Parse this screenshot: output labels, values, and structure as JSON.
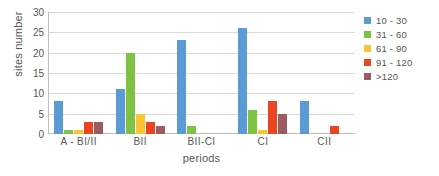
{
  "chart_data": {
    "type": "bar",
    "title": "",
    "xlabel": "periods",
    "ylabel": "sites number",
    "ylim": [
      0,
      30
    ],
    "yticks": [
      0,
      5,
      10,
      15,
      20,
      25,
      30
    ],
    "grid": true,
    "legend_position": "right",
    "categories": [
      "A - BI/II",
      "BII",
      "BII-CI",
      "CI",
      "CII"
    ],
    "series": [
      {
        "name": "10 - 30",
        "color": "#5B9BD5",
        "values": [
          8,
          11,
          23,
          26,
          8
        ]
      },
      {
        "name": "31 - 60",
        "color": "#7DC242",
        "values": [
          1,
          20,
          2,
          6,
          0
        ]
      },
      {
        "name": "61 - 90",
        "color": "#FDC432",
        "values": [
          1,
          5,
          0,
          1,
          0
        ]
      },
      {
        "name": "91 - 120",
        "color": "#EA4420",
        "values": [
          3,
          3,
          0,
          8,
          2
        ]
      },
      {
        "name": ">120",
        "color": "#9C5B62",
        "values": [
          3,
          2,
          0,
          5,
          0
        ]
      }
    ]
  },
  "axes": {
    "y_title": "sites number",
    "x_title": "periods",
    "y_tick_labels": [
      "0",
      "5",
      "10",
      "15",
      "20",
      "25",
      "30"
    ],
    "x_tick_labels": [
      "A - BI/II",
      "BII",
      "BII-CI",
      "CI",
      "CII"
    ]
  },
  "legend": {
    "items": [
      {
        "label": "10 - 30",
        "color": "#5B9BD5"
      },
      {
        "label": "31 - 60",
        "color": "#7DC242"
      },
      {
        "label": "61 - 90",
        "color": "#FDC432"
      },
      {
        "label": "91 - 120",
        "color": "#EA4420"
      },
      {
        "label": ">120",
        "color": "#9C5B62"
      }
    ]
  }
}
